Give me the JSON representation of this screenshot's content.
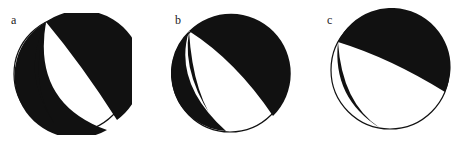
{
  "figure": {
    "type": "focal-mechanism-beachballs",
    "panels": [
      {
        "label": "a",
        "fill_color": "#111111",
        "background_color": "#ffffff"
      },
      {
        "label": "b",
        "fill_color": "#111111",
        "background_color": "#ffffff"
      },
      {
        "label": "c",
        "fill_color": "#111111",
        "background_color": "#ffffff"
      }
    ]
  }
}
